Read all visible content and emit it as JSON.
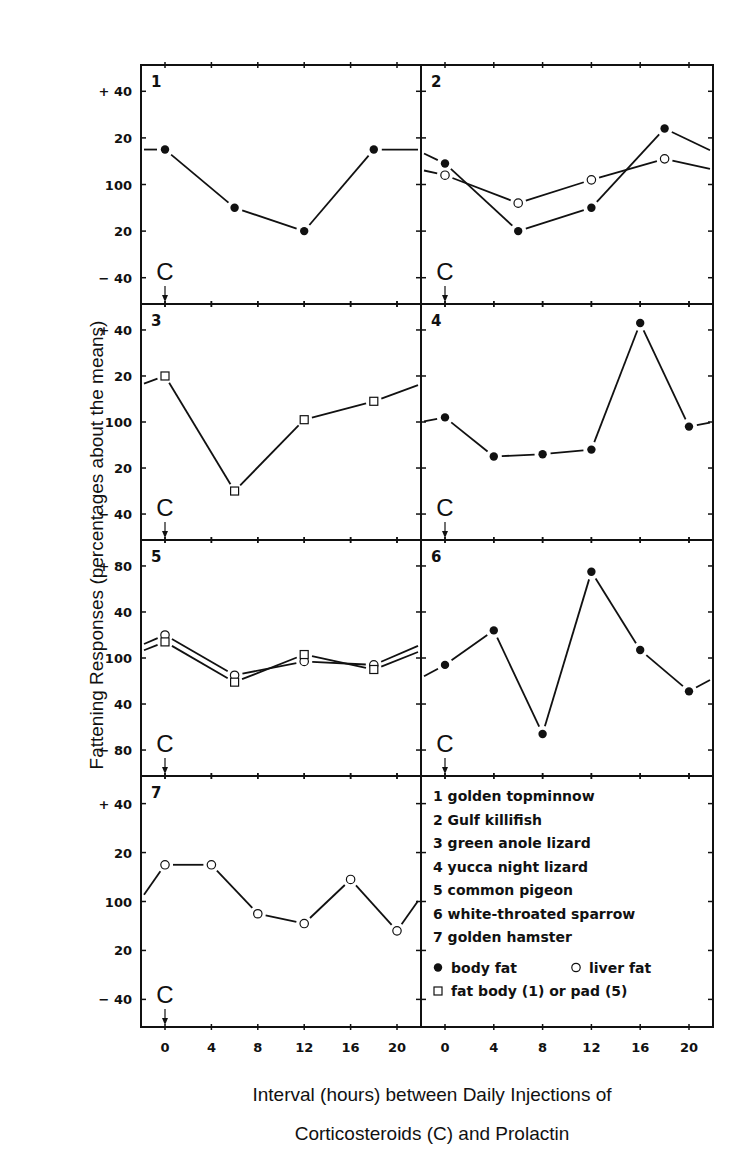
{
  "chart_data": {
    "type": "line",
    "title": "",
    "xlabel": "Interval (hours) between Daily Injections of Corticosteroids (C) and Prolactin",
    "xlabel_lines": [
      "Interval (hours) between Daily Injections of",
      "Corticosteroids (C) and Prolactin"
    ],
    "ylabel": "Fattening Responses (percentages about the means)",
    "x_ticks": [
      0,
      4,
      8,
      12,
      16,
      20
    ],
    "injection_marker": {
      "label": "C",
      "x": 0
    },
    "grid": false,
    "legend_position": "panel 8 (bottom right)",
    "panels": [
      {
        "id": 1,
        "species": "golden topminnow",
        "y_tick_labels": [
          "+ 40",
          "20",
          "100",
          "20",
          "− 40"
        ],
        "ylim": [
          -40,
          40
        ],
        "series": [
          {
            "name": "body fat",
            "marker": "filled-circle",
            "x": [
              0,
              6,
              12,
              18
            ],
            "values": [
              15,
              -10,
              -20,
              15
            ]
          }
        ]
      },
      {
        "id": 2,
        "species": "Gulf killifish",
        "y_tick_labels": [
          "+ 40",
          "20",
          "100",
          "20",
          "− 40"
        ],
        "ylim": [
          -40,
          40
        ],
        "series": [
          {
            "name": "body fat",
            "marker": "filled-circle",
            "x": [
              0,
              6,
              12,
              18
            ],
            "values": [
              9,
              -20,
              -10,
              24
            ]
          },
          {
            "name": "liver fat",
            "marker": "open-circle",
            "x": [
              0,
              6,
              12,
              18
            ],
            "values": [
              4,
              -8,
              2,
              11
            ]
          }
        ]
      },
      {
        "id": 3,
        "species": "green anole lizard",
        "y_tick_labels": [
          "+ 40",
          "20",
          "100",
          "20",
          "− 40"
        ],
        "ylim": [
          -40,
          40
        ],
        "series": [
          {
            "name": "fat body",
            "marker": "open-square",
            "x": [
              0,
              6,
              12,
              18
            ],
            "values": [
              20,
              -30,
              1,
              9
            ]
          }
        ]
      },
      {
        "id": 4,
        "species": "yucca night lizard",
        "y_tick_labels": [
          "+ 40",
          "20",
          "100",
          "20",
          "− 40"
        ],
        "ylim": [
          -40,
          40
        ],
        "series": [
          {
            "name": "body fat",
            "marker": "filled-circle",
            "x": [
              0,
              4,
              8,
              12,
              16,
              20
            ],
            "values": [
              2,
              -15,
              -14,
              -12,
              43,
              -2
            ]
          }
        ]
      },
      {
        "id": 5,
        "species": "common pigeon",
        "y_tick_labels": [
          "+ 80",
          "40",
          "100",
          "40",
          "− 80"
        ],
        "ylim": [
          -80,
          80
        ],
        "series": [
          {
            "name": "liver fat",
            "marker": "open-circle",
            "x": [
              0,
              6,
              12,
              18
            ],
            "values": [
              20,
              -15,
              -3,
              -6
            ]
          },
          {
            "name": "fat pad",
            "marker": "open-square",
            "x": [
              0,
              6,
              12,
              18
            ],
            "values": [
              14,
              -21,
              3,
              -10
            ]
          }
        ]
      },
      {
        "id": 6,
        "species": "white-throated sparrow",
        "y_tick_labels": [
          "+ 80",
          "40",
          "100",
          "40",
          "− 80"
        ],
        "ylim": [
          -80,
          80
        ],
        "series": [
          {
            "name": "body fat",
            "marker": "filled-circle",
            "x": [
              0,
              4,
              8,
              12,
              16,
              20
            ],
            "values": [
              -6,
              24,
              -66,
              75,
              7,
              -29
            ]
          }
        ]
      },
      {
        "id": 7,
        "species": "golden hamster",
        "y_tick_labels": [
          "+ 40",
          "20",
          "100",
          "20",
          "− 40"
        ],
        "ylim": [
          -40,
          40
        ],
        "series": [
          {
            "name": "liver fat",
            "marker": "open-circle",
            "x": [
              0,
              4,
              8,
              12,
              16,
              20
            ],
            "values": [
              15,
              15,
              -5,
              -9,
              9,
              -12
            ]
          }
        ]
      }
    ],
    "legend": {
      "species": [
        {
          "num": "1",
          "name": "golden  topminnow"
        },
        {
          "num": "2",
          "name": "Gulf  killifish"
        },
        {
          "num": "3",
          "name": "green  anole lizard"
        },
        {
          "num": "4",
          "name": "yucca  night  lizard"
        },
        {
          "num": "5",
          "name": "common  pigeon"
        },
        {
          "num": "6",
          "name": "white-throated  sparrow"
        },
        {
          "num": "7",
          "name": "golden  hamster"
        }
      ],
      "markers": [
        {
          "symbol": "filled-circle",
          "label": "body  fat"
        },
        {
          "symbol": "open-circle",
          "label": "liver  fat"
        },
        {
          "symbol": "open-square",
          "label": "fat body (1) or  pad (5)"
        }
      ]
    }
  },
  "colors": {
    "ink": "#111111",
    "background": "#ffffff"
  }
}
